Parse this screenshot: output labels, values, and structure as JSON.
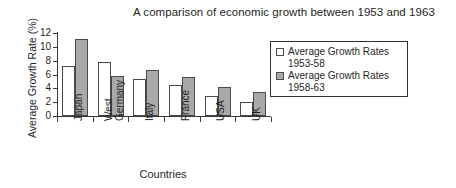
{
  "chart_data": {
    "type": "bar",
    "title": "A comparison of economic growth between 1953 and 1963",
    "xlabel": "Countries",
    "ylabel": "Average Growth Rate (%)",
    "categories": [
      "Japan",
      "West\nGermany",
      "Italy",
      "France",
      "USA",
      "UK"
    ],
    "series": [
      {
        "name": "Average Growth Rates\n1953-58",
        "color": "#ffffff",
        "values": [
          7.3,
          7.8,
          5.3,
          4.5,
          2.9,
          2.0
        ]
      },
      {
        "name": "Average Growth Rates\n1958-63",
        "color": "#a9a9a9",
        "values": [
          11.2,
          5.8,
          6.6,
          5.6,
          4.2,
          3.5
        ]
      }
    ],
    "ylim": [
      0,
      12
    ],
    "yticks": [
      0,
      2,
      4,
      6,
      8,
      10,
      12
    ],
    "ytick_labels": [
      "0",
      "2",
      "4",
      "6",
      "8",
      "10",
      "12"
    ],
    "grid": false,
    "legend_position": "right"
  }
}
